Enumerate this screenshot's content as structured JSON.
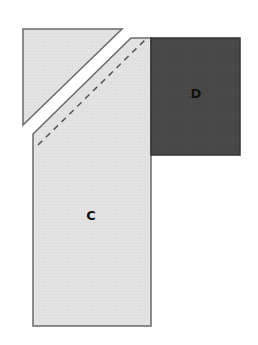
{
  "diagram": {
    "pieces": [
      {
        "id": "triangle",
        "label": "",
        "fill": "#e2e2e2",
        "stroke": "#6a6a6a"
      },
      {
        "id": "C",
        "label": "C",
        "fill": "#e2e2e2",
        "stroke": "#6a6a6a",
        "dashed_seam": true
      },
      {
        "id": "D",
        "label": "D",
        "fill": "#4b4b4b",
        "stroke": "#333333"
      }
    ]
  }
}
